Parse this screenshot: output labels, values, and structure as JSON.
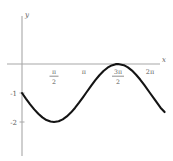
{
  "chart_data": {
    "type": "line",
    "title": "",
    "subtitle": "",
    "xlabel": "x",
    "ylabel": "y",
    "xlim": [
      -0.35,
      7.4
    ],
    "ylim": [
      -2.75,
      0.9
    ],
    "grid": false,
    "legend": null,
    "x_tick_labels": [
      "π/2",
      "π",
      "3π/2",
      "2π"
    ],
    "x_tick_values": [
      1.5708,
      3.1416,
      4.7124,
      6.2832
    ],
    "y_tick_labels": [
      "-1",
      "-2"
    ],
    "y_tick_values": [
      -1,
      -2
    ],
    "series": [
      {
        "name": "y = -1 - sin(x)",
        "x": [
          0.0,
          0.2,
          0.4,
          0.6,
          0.8,
          1.0,
          1.2,
          1.4,
          1.5708,
          1.8,
          2.0,
          2.2,
          2.4,
          2.6,
          2.8,
          3.0,
          3.1416,
          3.4,
          3.6,
          3.8,
          4.0,
          4.2,
          4.4,
          4.6,
          4.7124,
          5.0,
          5.2,
          5.4,
          5.6,
          5.8,
          6.0,
          6.2832,
          6.5,
          6.8,
          7.0
        ],
        "values": [
          -1.0,
          -1.199,
          -1.389,
          -1.565,
          -1.717,
          -1.841,
          -1.932,
          -1.985,
          -2.0,
          -1.974,
          -1.909,
          -1.808,
          -1.675,
          -1.516,
          -1.335,
          -1.141,
          -1.0,
          -0.744,
          -0.558,
          -0.388,
          -0.243,
          -0.128,
          -0.048,
          -0.006,
          0.0,
          -0.041,
          -0.117,
          -0.228,
          -0.369,
          -0.535,
          -0.721,
          -1.0,
          -1.215,
          -1.506,
          -1.657
        ]
      }
    ]
  },
  "labels": {
    "y_axis_name": "y",
    "x_axis_name": "x",
    "tick_pi_over_2_num": "π",
    "tick_pi_over_2_den": "2",
    "tick_pi": "π",
    "tick_3pi_over_2_num": "3π",
    "tick_3pi_over_2_den": "2",
    "tick_2pi": "2π",
    "tick_minus_one": "-1",
    "tick_minus_two": "-2"
  },
  "colors": {
    "curve": "#141414",
    "axis": "#a8a8a8",
    "text": "#5e5e5e",
    "background": "#ffffff"
  }
}
